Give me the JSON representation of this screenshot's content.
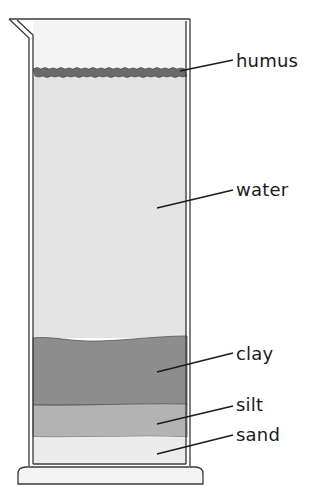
{
  "diagram": {
    "type": "soil-sedimentation-cylinder",
    "layers": [
      {
        "id": "humus",
        "label": "humus",
        "color": "#6e6e6e"
      },
      {
        "id": "water",
        "label": "water",
        "color": "#e4e4e4"
      },
      {
        "id": "clay",
        "label": "clay",
        "color": "#8c8c8c"
      },
      {
        "id": "silt",
        "label": "silt",
        "color": "#b4b4b4"
      },
      {
        "id": "sand",
        "label": "sand",
        "color": "#ececec"
      }
    ]
  }
}
